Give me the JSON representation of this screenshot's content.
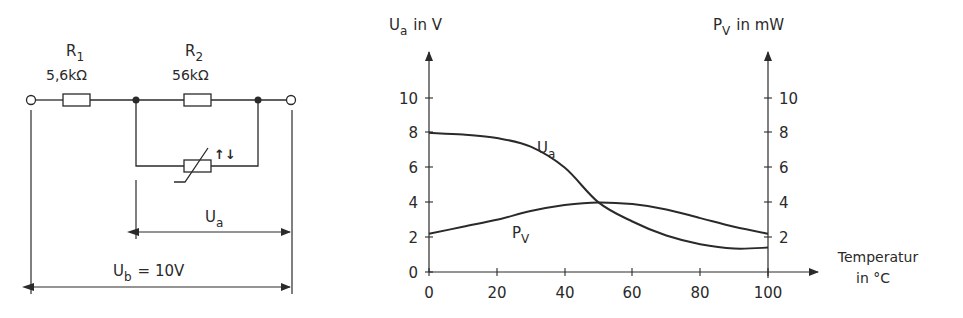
{
  "circuit": {
    "r1": {
      "name": "R",
      "sub": "1",
      "value": "5,6kΩ"
    },
    "r2": {
      "name": "R",
      "sub": "2",
      "value": "56kΩ"
    },
    "ua": {
      "name": "U",
      "sub": "a"
    },
    "ub": {
      "name": "U",
      "sub": "b",
      "value": "= 10V"
    },
    "thermistor_symbol": "↑↓"
  },
  "chart": {
    "left_axis": {
      "sym": "U",
      "sub": "a",
      "unit": "in  V"
    },
    "right_axis": {
      "sym": "P",
      "sub": "V",
      "unit": "in  mW"
    },
    "x_axis": {
      "line1": "Temperatur",
      "line2": "in  °C"
    },
    "series_labels": {
      "ua": {
        "sym": "U",
        "sub": "a"
      },
      "pv": {
        "sym": "P",
        "sub": "V"
      }
    }
  },
  "chart_data": {
    "type": "line",
    "title": "",
    "xlabel": "Temperatur in °C",
    "ylabel": "Ua in V",
    "ylabel_right": "PV in mW",
    "xlim": [
      0,
      100
    ],
    "ylim": [
      0,
      10
    ],
    "ylim_right": [
      0,
      10
    ],
    "x_ticks": [
      "0",
      "20",
      "40",
      "60",
      "80",
      "100"
    ],
    "y_ticks": [
      "0",
      "2",
      "4",
      "6",
      "8",
      "10"
    ],
    "y_ticks_right": [
      "2",
      "4",
      "6",
      "8",
      "10"
    ],
    "grid": false,
    "x": [
      0,
      10,
      20,
      30,
      40,
      50,
      60,
      70,
      80,
      90,
      100
    ],
    "series": [
      {
        "name": "Ua",
        "axis": "left",
        "values": [
          8.0,
          7.9,
          7.7,
          7.2,
          6.0,
          4.0,
          2.9,
          2.1,
          1.6,
          1.35,
          1.4
        ]
      },
      {
        "name": "PV",
        "axis": "right",
        "values": [
          2.2,
          2.6,
          3.0,
          3.5,
          3.85,
          4.0,
          3.9,
          3.6,
          3.1,
          2.6,
          2.2
        ]
      }
    ],
    "circuit": {
      "R1": "5,6kΩ",
      "R2": "56kΩ",
      "Ub": "10V",
      "output": "Ua across R2 || NTC thermistor"
    }
  }
}
